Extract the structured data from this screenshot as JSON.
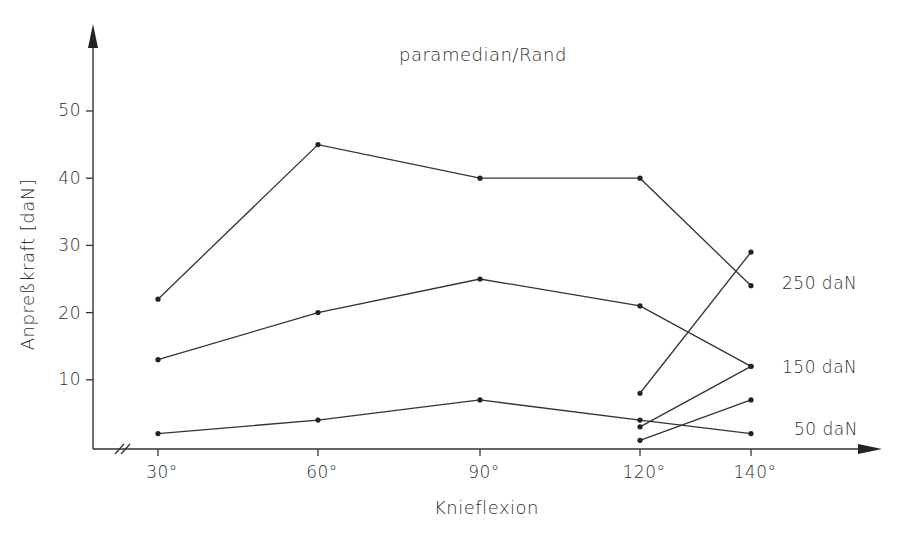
{
  "chart_data": {
    "type": "line",
    "title": "paramedian/Rand",
    "xlabel": "Knieflexion",
    "ylabel": "Anpreßkraft [daN]",
    "categories": [
      "30°",
      "60°",
      "90°",
      "120°",
      "140°"
    ],
    "y_ticks": [
      "10",
      "20",
      "30",
      "40",
      "50"
    ],
    "ylim": [
      0,
      60
    ],
    "grid": false,
    "axis_break_on_x": true,
    "legend_position": "right, inline labels",
    "series": [
      {
        "name": "250 daN",
        "x": [
          "30°",
          "60°",
          "90°",
          "120°",
          "140°"
        ],
        "values": [
          22,
          45,
          40,
          40,
          24
        ]
      },
      {
        "name": "150 daN",
        "x": [
          "30°",
          "60°",
          "90°",
          "120°",
          "140°"
        ],
        "values": [
          13,
          20,
          25,
          21,
          12
        ]
      },
      {
        "name": "50 daN",
        "x": [
          "30°",
          "60°",
          "90°",
          "120°",
          "140°"
        ],
        "values": [
          2,
          4,
          7,
          4,
          2
        ]
      },
      {
        "name": "250 daN (120°–140°)",
        "x": [
          "120°",
          "140°"
        ],
        "values": [
          8,
          29
        ]
      },
      {
        "name": "150 daN (120°–140°)",
        "x": [
          "120°",
          "140°"
        ],
        "values": [
          3,
          12
        ]
      },
      {
        "name": "50 daN (120°–140°)",
        "x": [
          "120°",
          "140°"
        ],
        "values": [
          1,
          7
        ]
      }
    ],
    "series_labels": [
      "250 daN",
      "150 daN",
      "50 daN"
    ]
  },
  "labels": {
    "title": "paramedian/Rand",
    "xlabel": "Knieflexion",
    "ylabel": "Anpreßkraft [daN]",
    "x_ticks": [
      "30°",
      "60°",
      "90°",
      "120°",
      "140°"
    ],
    "y_ticks": [
      "10",
      "20",
      "30",
      "40",
      "50"
    ],
    "legend": [
      "250 daN",
      "150 daN",
      "50 daN"
    ]
  },
  "colors": {
    "line": "#333333",
    "text": "#2e2e2e",
    "background": "#ffffff"
  }
}
